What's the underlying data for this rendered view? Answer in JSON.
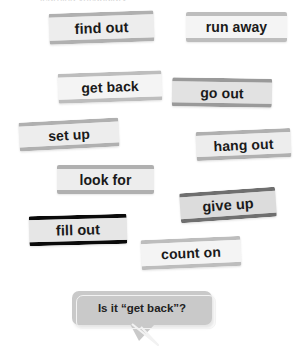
{
  "page": {
    "background": "#ffffff",
    "width": 298,
    "height": 348,
    "top_cut_text": "learning vocabulary"
  },
  "colors": {
    "card_text": "#1a1a1a",
    "card_face_pale": "#f4f4f4",
    "card_face_light": "#ededed",
    "card_face_mid": "#e2e2e2",
    "card_face_grey": "#d8d8d8",
    "card_edge_light": "#bdbdbd",
    "card_edge_mid": "#9a9a9a",
    "card_edge_dark": "#6f6f6f",
    "card_edge_black": "#0b0b0b",
    "bubble_fill": "#c9c9c9",
    "bubble_text": "#212121"
  },
  "cards": [
    {
      "label": "find out",
      "tone": "light",
      "left": 49,
      "top": 12,
      "width": 105,
      "height": 31,
      "rotate": -2.0,
      "font": 14.5
    },
    {
      "label": "run away",
      "tone": "pale",
      "left": 186,
      "top": 12,
      "width": 101,
      "height": 30,
      "rotate": 0.0,
      "font": 14.0
    },
    {
      "label": "get back",
      "tone": "pale",
      "left": 58,
      "top": 72,
      "width": 104,
      "height": 30,
      "rotate": -2.0,
      "font": 14.0
    },
    {
      "label": "go out",
      "tone": "mid",
      "left": 172,
      "top": 78,
      "width": 100,
      "height": 29,
      "rotate": 1.0,
      "font": 14.0
    },
    {
      "label": "set up",
      "tone": "light",
      "left": 19,
      "top": 120,
      "width": 100,
      "height": 29,
      "rotate": -3.0,
      "font": 14.0
    },
    {
      "label": "hang out",
      "tone": "light",
      "left": 196,
      "top": 130,
      "width": 95,
      "height": 29,
      "rotate": -2.5,
      "font": 14.0
    },
    {
      "label": "look for",
      "tone": "light",
      "left": 57,
      "top": 165,
      "width": 97,
      "height": 29,
      "rotate": 0.0,
      "font": 14.0
    },
    {
      "label": "give up",
      "tone": "dark",
      "left": 180,
      "top": 190,
      "width": 96,
      "height": 30,
      "rotate": -4.0,
      "font": 14.5
    },
    {
      "label": "fill out",
      "tone": "black",
      "left": 29,
      "top": 215,
      "width": 98,
      "height": 30,
      "rotate": -1.5,
      "font": 14.5
    },
    {
      "label": "count on",
      "tone": "pale",
      "left": 141,
      "top": 238,
      "width": 100,
      "height": 30,
      "rotate": -2.5,
      "font": 14.0
    }
  ],
  "bubble": {
    "text": "Is it “get back”?"
  }
}
